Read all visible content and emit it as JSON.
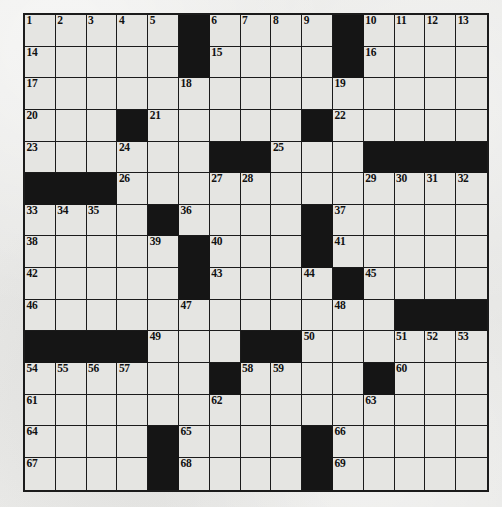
{
  "puzzle": {
    "title": "Crossword Puzzle Grid",
    "type": "crossword",
    "rows": 15,
    "cols": 15,
    "colors": {
      "paper": "#e9e9e7",
      "cell_fill": "#e5e5e2",
      "block_fill": "#151515",
      "grid_line": "#1b1b1b",
      "number_text": "#111111"
    },
    "grid": [
      [
        {
          "n": "1"
        },
        {
          "n": "2"
        },
        {
          "n": "3"
        },
        {
          "n": "4"
        },
        {
          "n": "5"
        },
        {
          "b": true
        },
        {
          "n": "6"
        },
        {
          "n": "7"
        },
        {
          "n": "8"
        },
        {
          "n": "9"
        },
        {
          "b": true
        },
        {
          "n": "10"
        },
        {
          "n": "11"
        },
        {
          "n": "12"
        },
        {
          "n": "13"
        }
      ],
      [
        {
          "n": "14"
        },
        {},
        {},
        {},
        {},
        {
          "b": true
        },
        {
          "n": "15"
        },
        {},
        {},
        {},
        {
          "b": true
        },
        {
          "n": "16"
        },
        {},
        {},
        {}
      ],
      [
        {
          "n": "17"
        },
        {},
        {},
        {},
        {},
        {
          "n": "18"
        },
        {},
        {},
        {},
        {},
        {
          "n": "19"
        },
        {},
        {},
        {},
        {}
      ],
      [
        {
          "n": "20"
        },
        {},
        {},
        {
          "b": true
        },
        {
          "n": "21"
        },
        {},
        {},
        {},
        {},
        {
          "b": true
        },
        {
          "n": "22"
        },
        {},
        {},
        {},
        {}
      ],
      [
        {
          "n": "23"
        },
        {},
        {},
        {
          "n": "24"
        },
        {},
        {},
        {
          "b": true
        },
        {
          "b": true
        },
        {
          "n": "25"
        },
        {},
        {},
        {
          "b": true
        },
        {
          "b": true
        },
        {
          "b": true
        },
        {
          "b": true
        }
      ],
      [
        {
          "b": true
        },
        {
          "b": true
        },
        {
          "b": true
        },
        {
          "n": "26"
        },
        {},
        {},
        {
          "n": "27"
        },
        {
          "n": "28"
        },
        {},
        {},
        {},
        {
          "n": "29"
        },
        {
          "n": "30"
        },
        {
          "n": "31"
        },
        {
          "n": "32"
        }
      ],
      [
        {
          "n": "33"
        },
        {
          "n": "34"
        },
        {
          "n": "35"
        },
        {},
        {
          "b": true
        },
        {
          "n": "36"
        },
        {},
        {},
        {},
        {
          "b": true
        },
        {
          "n": "37"
        },
        {},
        {},
        {},
        {}
      ],
      [
        {
          "n": "38"
        },
        {},
        {},
        {},
        {
          "n": "39"
        },
        {
          "b": true
        },
        {
          "n": "40"
        },
        {},
        {},
        {
          "b": true
        },
        {
          "n": "41"
        },
        {},
        {},
        {},
        {}
      ],
      [
        {
          "n": "42"
        },
        {},
        {},
        {},
        {},
        {
          "b": true
        },
        {
          "n": "43"
        },
        {},
        {},
        {
          "n": "44"
        },
        {
          "b": true
        },
        {
          "n": "45"
        },
        {},
        {},
        {}
      ],
      [
        {
          "n": "46"
        },
        {},
        {},
        {},
        {},
        {
          "n": "47"
        },
        {},
        {},
        {},
        {},
        {
          "n": "48"
        },
        {},
        {
          "b": true
        },
        {
          "b": true
        },
        {
          "b": true
        }
      ],
      [
        {
          "b": true
        },
        {
          "b": true
        },
        {
          "b": true
        },
        {
          "b": true
        },
        {
          "n": "49"
        },
        {},
        {},
        {
          "b": true
        },
        {
          "b": true
        },
        {
          "n": "50"
        },
        {},
        {},
        {
          "n": "51"
        },
        {
          "n": "52"
        },
        {
          "n": "53"
        }
      ],
      [
        {
          "n": "54"
        },
        {
          "n": "55"
        },
        {
          "n": "56"
        },
        {
          "n": "57"
        },
        {},
        {},
        {
          "b": true
        },
        {
          "n": "58"
        },
        {
          "n": "59"
        },
        {},
        {},
        {
          "b": true
        },
        {
          "n": "60"
        },
        {},
        {}
      ],
      [
        {
          "n": "61"
        },
        {},
        {},
        {},
        {},
        {},
        {
          "n": "62"
        },
        {},
        {},
        {},
        {},
        {
          "n": "63"
        },
        {},
        {},
        {}
      ],
      [
        {
          "n": "64"
        },
        {},
        {},
        {},
        {
          "b": true
        },
        {
          "n": "65"
        },
        {},
        {},
        {},
        {
          "b": true
        },
        {
          "n": "66"
        },
        {},
        {},
        {},
        {}
      ],
      [
        {
          "n": "67"
        },
        {},
        {},
        {},
        {
          "b": true
        },
        {
          "n": "68"
        },
        {},
        {},
        {},
        {
          "b": true
        },
        {
          "n": "69"
        },
        {},
        {},
        {},
        {}
      ]
    ]
  }
}
